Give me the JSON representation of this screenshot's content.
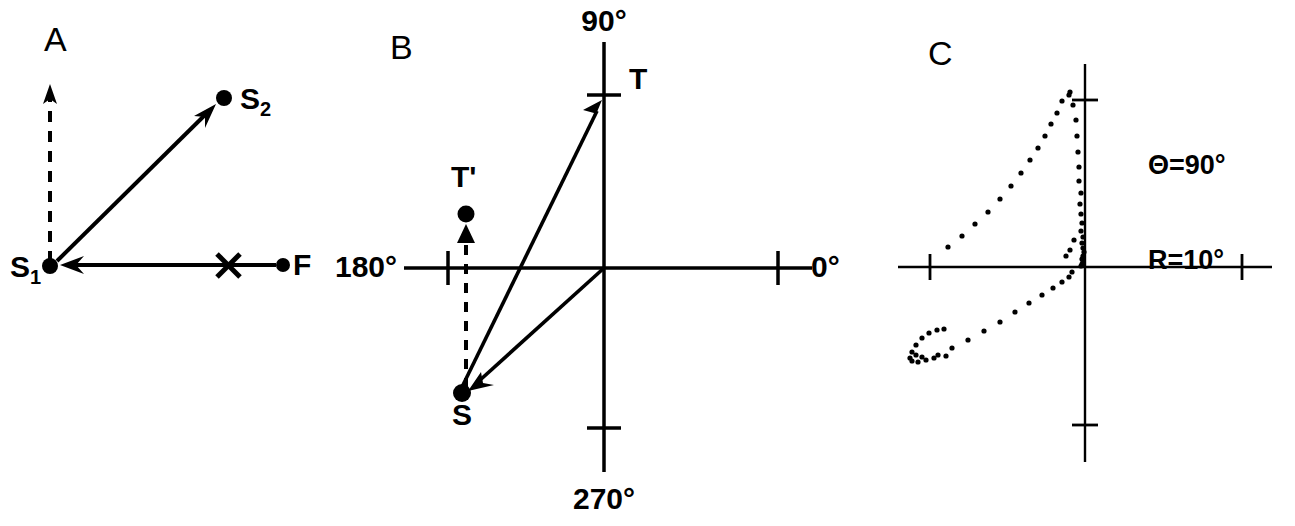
{
  "figure": {
    "background_color": "#ffffff",
    "ink_color": "#000000",
    "width": 1295,
    "height": 526
  },
  "panels": [
    {
      "id": "A",
      "label": "A",
      "label_pos": [
        44,
        22
      ],
      "points": [
        {
          "name": "S1",
          "label": "S",
          "sub": "1",
          "sub_style": "bar",
          "x": 50,
          "y": 267,
          "marker": "dot"
        },
        {
          "name": "S2",
          "label": "S",
          "sub": "2",
          "sub_style": "digit",
          "x": 224,
          "y": 98,
          "marker": "dot"
        },
        {
          "name": "F",
          "label": "F",
          "sub": "",
          "sub_style": "none",
          "x": 283,
          "y": 265,
          "marker": "dot"
        },
        {
          "name": "X",
          "label": "X",
          "sub": "",
          "sub_style": "none",
          "x": 228,
          "y": 265,
          "marker": "cross-glyph"
        }
      ],
      "arrows": [
        {
          "name": "dashed-vertical-arrow",
          "from": [
            50,
            262
          ],
          "to": [
            50,
            88
          ],
          "style": "dashed"
        },
        {
          "name": "s1-to-s2-arrow",
          "from": [
            56,
            261
          ],
          "to": [
            214,
            106
          ],
          "style": "solid"
        },
        {
          "name": "f-to-s1-arrow",
          "from": [
            276,
            265
          ],
          "to": [
            62,
            265
          ],
          "style": "solid"
        }
      ]
    },
    {
      "id": "B",
      "label": "B",
      "label_pos": [
        390,
        30
      ],
      "axes": {
        "origin": [
          604,
          268
        ],
        "x_axis": {
          "from": [
            404,
            268
          ],
          "to": [
            812,
            268
          ]
        },
        "y_axis": {
          "from": [
            604,
            42
          ],
          "to": [
            604,
            472
          ]
        },
        "ticks": [
          {
            "name": "tick-180",
            "x": 448,
            "y": 268,
            "orient": "vertical",
            "len": 34
          },
          {
            "name": "tick-0",
            "x": 778,
            "y": 268,
            "orient": "vertical",
            "len": 34
          },
          {
            "name": "tick-90",
            "x": 604,
            "y": 95,
            "orient": "horizontal",
            "len": 34
          },
          {
            "name": "tick-270",
            "x": 604,
            "y": 428,
            "orient": "horizontal",
            "len": 34
          }
        ]
      },
      "axis_labels": [
        {
          "name": "label-90",
          "text": "90°",
          "x": 604,
          "y": 22,
          "anchor": "middle"
        },
        {
          "name": "label-270",
          "text": "270°",
          "x": 604,
          "y": 500,
          "anchor": "middle"
        },
        {
          "name": "label-0",
          "text": "0°",
          "x": 800,
          "y": 268,
          "anchor": "start"
        },
        {
          "name": "label-180",
          "text": "180°",
          "x": 398,
          "y": 268,
          "anchor": "end",
          "one_as_bar": true
        }
      ],
      "points": [
        {
          "name": "T",
          "label": "T",
          "x": 604,
          "y": 95,
          "marker": "tick",
          "label_x": 630,
          "label_y": 80
        },
        {
          "name": "T-prime",
          "label": "T'",
          "x": 466,
          "y": 220,
          "marker": "dot",
          "label_x": 462,
          "label_y": 178
        },
        {
          "name": "T-prime-arrowhead",
          "label": "",
          "x": 466,
          "y": 236,
          "marker": "triangle-up"
        },
        {
          "name": "S",
          "label": "S",
          "x": 462,
          "y": 393,
          "marker": "dot",
          "label_x": 462,
          "label_y": 404
        }
      ],
      "arrows": [
        {
          "name": "s-to-t-arrow",
          "from": [
            462,
            387
          ],
          "to": [
            600,
            105
          ],
          "style": "solid"
        },
        {
          "name": "origin-to-s-arrow",
          "from": [
            604,
            268
          ],
          "to": [
            471,
            388
          ],
          "style": "solid"
        },
        {
          "name": "s-to-tprime-dashed",
          "from": [
            466,
            386
          ],
          "to": [
            466,
            240
          ],
          "style": "dashed"
        }
      ]
    },
    {
      "id": "C",
      "label": "C",
      "label_pos": [
        928,
        36
      ]
    }
  ],
  "chart_data": {
    "type": "scatter",
    "title": "",
    "xlabel": "",
    "ylabel": "",
    "grid": false,
    "legend": false,
    "annotations": [
      {
        "name": "theta-annotation",
        "text": "Θ=90°",
        "x": 1148,
        "y": 100
      },
      {
        "name": "r-annotation",
        "text": "R=10°",
        "x": 1148,
        "y": 130,
        "one_as_bar": true
      }
    ],
    "axes": {
      "origin_px": [
        1085,
        267
      ],
      "x_axis_px": {
        "from": [
          898,
          267
        ],
        "to": [
          1272,
          267
        ]
      },
      "y_axis_px": {
        "from": [
          1085,
          64
        ],
        "to": [
          1085,
          462
        ]
      },
      "ticks_px": [
        {
          "name": "tick-x-left",
          "x": 930,
          "y": 267,
          "orient": "vertical",
          "len": 26
        },
        {
          "name": "tick-x-right",
          "x": 1242,
          "y": 267,
          "orient": "vertical",
          "len": 26
        },
        {
          "name": "tick-y-top",
          "x": 1085,
          "y": 100,
          "orient": "horizontal",
          "len": 26
        },
        {
          "name": "tick-y-bottom",
          "x": 1085,
          "y": 425,
          "orient": "horizontal",
          "len": 26
        }
      ]
    },
    "points_px": [
      [
        1081,
        266
      ],
      [
        1082,
        264
      ],
      [
        1083,
        262
      ],
      [
        1082,
        259
      ],
      [
        1083,
        256
      ],
      [
        1084,
        252
      ],
      [
        1083,
        248
      ],
      [
        1082,
        243
      ],
      [
        1083,
        237
      ],
      [
        1081,
        231
      ],
      [
        1082,
        223
      ],
      [
        1081,
        214
      ],
      [
        1080,
        204
      ],
      [
        1081,
        193
      ],
      [
        1079,
        181
      ],
      [
        1079,
        167
      ],
      [
        1078,
        152
      ],
      [
        1077,
        136
      ],
      [
        1076,
        120
      ],
      [
        1073,
        105
      ],
      [
        1069,
        95
      ],
      [
        1070,
        92
      ],
      [
        1062,
        101
      ],
      [
        1057,
        113
      ],
      [
        1051,
        124
      ],
      [
        1045,
        136
      ],
      [
        1038,
        148
      ],
      [
        1030,
        160
      ],
      [
        1021,
        173
      ],
      [
        1011,
        186
      ],
      [
        1000,
        199
      ],
      [
        988,
        212
      ],
      [
        975,
        224
      ],
      [
        962,
        236
      ],
      [
        948,
        247
      ],
      [
        1066,
        256
      ],
      [
        1070,
        250
      ],
      [
        1074,
        240
      ],
      [
        1072,
        272
      ],
      [
        1069,
        277
      ],
      [
        1062,
        282
      ],
      [
        1053,
        288
      ],
      [
        1042,
        295
      ],
      [
        1029,
        303
      ],
      [
        1015,
        312
      ],
      [
        1000,
        322
      ],
      [
        984,
        331
      ],
      [
        968,
        340
      ],
      [
        952,
        348
      ],
      [
        938,
        355
      ],
      [
        926,
        360
      ],
      [
        918,
        362
      ],
      [
        912,
        361
      ],
      [
        910,
        358
      ],
      [
        912,
        352
      ],
      [
        916,
        345
      ],
      [
        922,
        338
      ],
      [
        929,
        333
      ],
      [
        937,
        330
      ],
      [
        944,
        329
      ],
      [
        946,
        356
      ],
      [
        934,
        358
      ],
      [
        922,
        357
      ],
      [
        916,
        355
      ]
    ],
    "point_radius_px": 2.6
  }
}
